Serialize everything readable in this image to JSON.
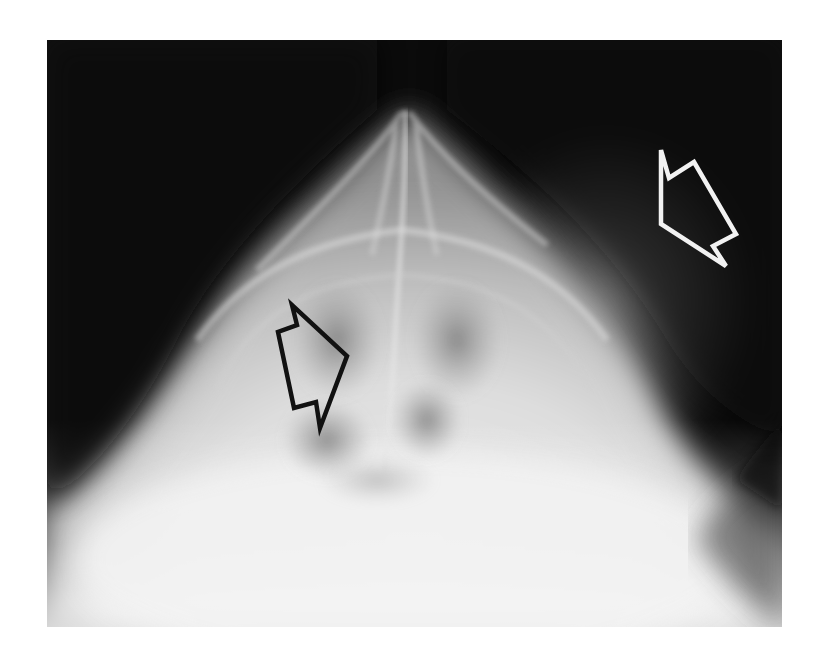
{
  "figure": {
    "type": "radiograph",
    "background_color": "#0a0a0a",
    "page_background": "#ffffff"
  },
  "annotations": [
    {
      "id": "arrow-soft-tissue",
      "style": "outline",
      "stroke_color": "#f2f2f2",
      "fill": "none",
      "direction": "down-right",
      "points": "614,110 622,138 647,122 689,194 666,206 679,226 614,184"
    },
    {
      "id": "arrow-sinus",
      "style": "outline",
      "stroke_color": "#111111",
      "fill": "none",
      "direction": "down-right",
      "points": "245,265 250,285 231,292 247,368 269,362 273,388 300,316"
    }
  ]
}
